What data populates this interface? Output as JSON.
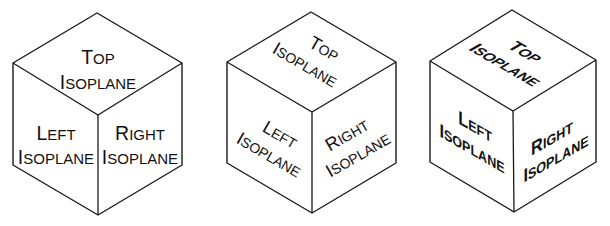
{
  "diagram": {
    "type": "isometric-cubes",
    "stroke_color": "#1a1a1a",
    "background": "#ffffff",
    "cubes": [
      {
        "id": "cube-1",
        "style": "horizontal text",
        "top": {
          "line1_cap": "T",
          "line1_rest": "OP",
          "line2_cap": "I",
          "line2_rest": "SOPLANE"
        },
        "left": {
          "line1_cap": "L",
          "line1_rest": "EFT",
          "line2_cap": "I",
          "line2_rest": "SOPLANE"
        },
        "right": {
          "line1_cap": "R",
          "line1_rest": "IGHT",
          "line2_cap": "I",
          "line2_rest": "SOPLANE"
        }
      },
      {
        "id": "cube-2",
        "style": "rotated text",
        "top": {
          "line1_cap": "T",
          "line1_rest": "OP",
          "line2_cap": "I",
          "line2_rest": "SOPLANE"
        },
        "left": {
          "line1_cap": "L",
          "line1_rest": "EFT",
          "line2_cap": "I",
          "line2_rest": "SOPLANE"
        },
        "right": {
          "line1_cap": "R",
          "line1_rest": "IGHT",
          "line2_cap": "I",
          "line2_rest": "SOPLANE"
        }
      },
      {
        "id": "cube-3",
        "style": "isometric (oblique) text",
        "top": {
          "line1_cap": "T",
          "line1_rest": "OP",
          "line2_cap": "I",
          "line2_rest": "SOPLANE"
        },
        "left": {
          "line1_cap": "L",
          "line1_rest": "EFT",
          "line2_cap": "I",
          "line2_rest": "SOPLANE"
        },
        "right": {
          "line1_cap": "R",
          "line1_rest": "IGHT",
          "line2_cap": "I",
          "line2_rest": "SOPLANE"
        }
      }
    ]
  }
}
